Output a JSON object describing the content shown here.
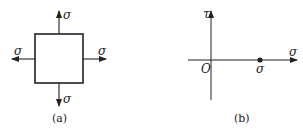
{
  "figure_a": {
    "caption": "(a)",
    "stress_labels": {
      "top": "σ",
      "bottom": "σ",
      "left": "σ",
      "right": "σ"
    }
  },
  "figure_b": {
    "caption": "(b)",
    "axis_labels": {
      "vertical": "τ",
      "horizontal": "σ",
      "origin": "O"
    },
    "point_label": "σ"
  },
  "colors": {
    "stroke": "#222222",
    "background": "#ffffff"
  }
}
